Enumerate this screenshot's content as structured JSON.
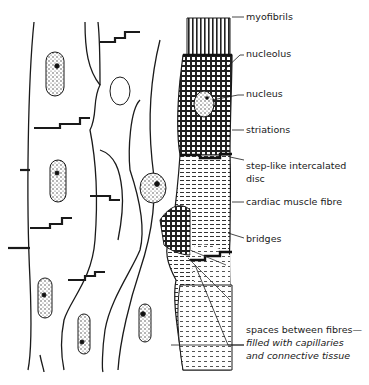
{
  "diagram": {
    "labels": [
      {
        "id": "myofibrils",
        "text": "myofibrils"
      },
      {
        "id": "nucleolus",
        "text": "nucleolus"
      },
      {
        "id": "nucleus",
        "text": "nucleus"
      },
      {
        "id": "striations",
        "text": "striations"
      },
      {
        "id": "intercalated-disc",
        "line1": "step-like intercalated",
        "line2": "disc"
      },
      {
        "id": "cardiac-muscle-fibre",
        "text": "cardiac muscle fibre"
      },
      {
        "id": "bridges",
        "text": "bridges"
      },
      {
        "id": "spaces",
        "line1": "spaces between fibres—",
        "line2": "filled with capillaries",
        "line3": "and connective tissue"
      }
    ],
    "colors": {
      "ink": "#1a1a1a",
      "background": "#ffffff"
    }
  }
}
